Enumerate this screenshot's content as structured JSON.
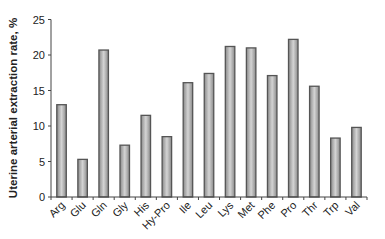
{
  "chart_data": {
    "type": "bar",
    "title": "",
    "xlabel": "",
    "ylabel": "Uterine arterial extraction rate, %",
    "ylim": [
      0,
      25
    ],
    "yticks": [
      0,
      5,
      10,
      15,
      20,
      25
    ],
    "grid": false,
    "legend": null,
    "categories": [
      "Arg",
      "Glu",
      "Gln",
      "Gly",
      "His",
      "Hy-Pro",
      "Ile",
      "Leu",
      "Lys",
      "Met",
      "Phe",
      "Pro",
      "Thr",
      "Trp",
      "Val"
    ],
    "values": [
      13.0,
      5.3,
      20.7,
      7.3,
      11.5,
      8.5,
      16.1,
      17.4,
      21.2,
      21.0,
      17.1,
      22.2,
      15.6,
      8.3,
      9.8
    ]
  },
  "style": {
    "bar_fill": "#bdbdbd",
    "bar_edge": "#555555",
    "axis_color": "#444444",
    "text_color": "#222222"
  }
}
